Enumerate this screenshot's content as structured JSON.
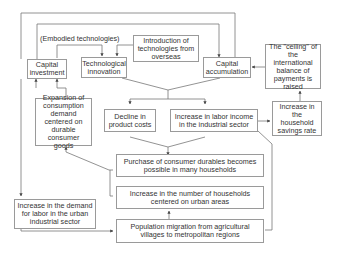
{
  "diagram": {
    "label_embodied": "(Embodied technologies)",
    "nodes": {
      "capital_investment": "Capital investment",
      "technological_innovation": "Technological innovation",
      "introduction_technologies": "Introduction of technologies from overseas",
      "capital_accumulation": "Capital accumulation",
      "ceiling_balance": "The \"ceiling\" of the international balance of payments is raised",
      "expansion_consumption": "Expansion of consumption demand centered on durable consumer goods",
      "decline_costs": "Decline in product costs",
      "labor_income": "Increase in labor income in the industrial sector",
      "household_savings": "Increase in the household savings rate",
      "purchase_durables": "Purchase of consumer durables becomes possible in many households",
      "labor_demand": "Increase in the demand for labor in the urban industrial sector",
      "urban_households": "Increase in the number of households centered on urban areas",
      "population_migration": "Population migration from agricultural villages to metropolitan regions"
    }
  }
}
